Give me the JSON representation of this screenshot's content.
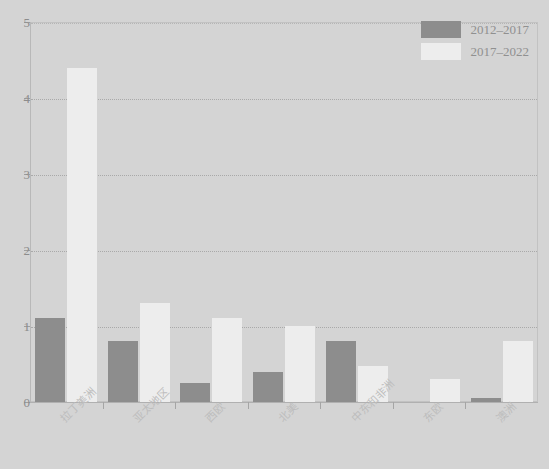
{
  "chart_data": {
    "type": "bar",
    "title": "",
    "subtitle": "",
    "xlabel": "",
    "ylabel": "",
    "ylim": [
      0,
      5
    ],
    "yticks": [
      0,
      1,
      2,
      3,
      4,
      5
    ],
    "ytick_labels": [
      "0",
      "1",
      "2",
      "3",
      "4",
      "5"
    ],
    "grid": true,
    "grid_axis": "y",
    "legend_position": "top-right",
    "categories": [
      "拉丁美洲",
      "亚太地区",
      "西欧",
      "北美",
      "中东和非洲",
      "东欧",
      "澳洲"
    ],
    "series": [
      {
        "name": "2012–2017",
        "color": "#8d8d8d",
        "values": [
          1.1,
          0.8,
          0.25,
          0.4,
          0.8,
          0.0,
          0.05
        ]
      },
      {
        "name": "2017–2022",
        "color": "#ededed",
        "values": [
          4.4,
          1.3,
          1.1,
          1.0,
          0.47,
          0.3,
          0.8
        ]
      }
    ]
  },
  "legend": {
    "entries": [
      {
        "label": "2012–2017"
      },
      {
        "label": "2017–2022"
      }
    ]
  },
  "colors": {
    "background": "#d4d4d4",
    "series_0": "#8d8d8d",
    "series_1": "#ededed",
    "gridline": "#a9a9a9",
    "axis": "#b0b0b0",
    "tick_text": "#8c8c8c",
    "category_text": "#bdbdbd"
  }
}
